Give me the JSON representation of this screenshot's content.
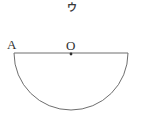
{
  "figure": {
    "caption": "ウ",
    "labels": {
      "left_endpoint": "A",
      "center_point": "O"
    },
    "geometry": {
      "shape": "lower-semicircle",
      "diameter_y": 53,
      "diameter_x_start": 14,
      "diameter_x_end": 128,
      "center_x": 71,
      "radius": 57,
      "center_dot_radius": 1.4
    },
    "colors": {
      "background": "#ffffff",
      "line": "#6e6e6e",
      "text": "#2f2f2f",
      "caption_text": "#3a3a3a",
      "dot": "#2f2f2f"
    }
  }
}
